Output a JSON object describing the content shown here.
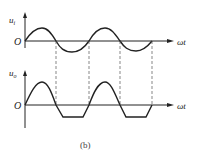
{
  "diagram": {
    "caption": "(b)",
    "top_plot": {
      "y_label": "u",
      "y_label_sub": "i",
      "x_label": "ωt",
      "origin_label": "O",
      "waveform": "sine"
    },
    "bottom_plot": {
      "y_label": "u",
      "y_label_sub": "o",
      "x_label": "ωt",
      "origin_label": "O",
      "waveform": "clipped sine (negative half limited)"
    },
    "colors": {
      "line": "#222222",
      "dashed": "#555555"
    }
  }
}
